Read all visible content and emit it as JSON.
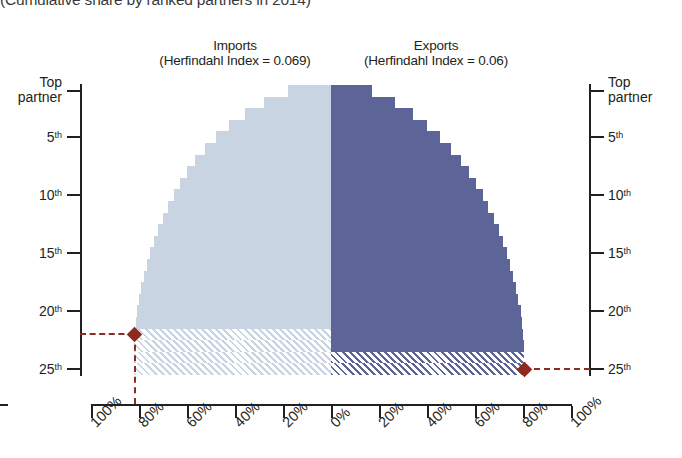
{
  "title": "(Cumulative share by ranked partners in 2014)",
  "panels": {
    "imports": {
      "name": "Imports",
      "subtitle": "(Herfindahl Index = 0.069)"
    },
    "exports": {
      "name": "Exports",
      "subtitle": "(Herfindahl Index = 0.06)"
    }
  },
  "axes": {
    "y_labels_top": "Top partner",
    "y_ticks": [
      "Top partner",
      "5",
      "10",
      "15",
      "20",
      "25"
    ],
    "y_suffix": "th",
    "x_ticks_left": [
      "100%",
      "80%",
      "60%",
      "40%",
      "20%",
      "0%"
    ],
    "x_ticks_right": [
      "0%",
      "20%",
      "40%",
      "60%",
      "80%",
      "100%"
    ]
  },
  "colors": {
    "imports": "#c9d4e3",
    "exports": "#5c6498",
    "marker": "#8d2b1e",
    "axis": "#231f20"
  },
  "chart_data": {
    "type": "bar",
    "orientation": "horizontal-diverging",
    "title": "(Cumulative share by ranked partners in 2014)",
    "xlabel": "",
    "ylabel": "Partner rank",
    "xlim": [
      0,
      100
    ],
    "ylim": [
      1,
      25
    ],
    "grid": false,
    "legend": "panel-headers",
    "categories": [
      "Top partner",
      "2nd",
      "3rd",
      "4th",
      "5th",
      "6th",
      "7th",
      "8th",
      "9th",
      "10th",
      "11th",
      "12th",
      "13th",
      "14th",
      "15th",
      "16th",
      "17th",
      "18th",
      "19th",
      "20th",
      "21st",
      "22nd",
      "23rd",
      "24th",
      "25th"
    ],
    "series": [
      {
        "name": "Imports",
        "herfindahl_index": 0.069,
        "direction": "left",
        "color": "#c9d4e3",
        "marker_rank": 22,
        "marker_value": 82,
        "hatched_from_rank": 22,
        "values": [
          18,
          28,
          36,
          42.5,
          48,
          52.5,
          56.5,
          60,
          63,
          65.5,
          68,
          70,
          72,
          73.8,
          75.4,
          76.8,
          78,
          79,
          79.9,
          80.7,
          81.4,
          82,
          82,
          82,
          82
        ]
      },
      {
        "name": "Exports",
        "herfindahl_index": 0.06,
        "direction": "right",
        "color": "#5c6498",
        "marker_rank": 25,
        "marker_value": 80.5,
        "hatched_from_rank": 24,
        "values": [
          17,
          26.5,
          34,
          40,
          45.5,
          50,
          54,
          57.5,
          60.5,
          63.2,
          65.6,
          67.8,
          69.8,
          71.6,
          73.2,
          74.6,
          75.9,
          77.1,
          78.1,
          79,
          79.6,
          80,
          80.3,
          80.5,
          80.5
        ]
      }
    ]
  }
}
